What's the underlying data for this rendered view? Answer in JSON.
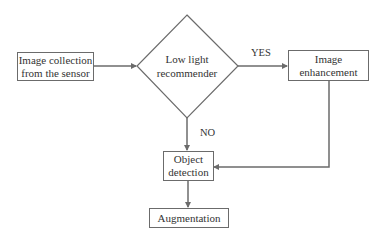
{
  "diagram": {
    "type": "flowchart",
    "nodes": {
      "collection": {
        "label_line1": "Image collection",
        "label_line2": "from the sensor",
        "shape": "rectangle"
      },
      "recommender": {
        "label_line1": "Low light",
        "label_line2": "recommender",
        "shape": "diamond"
      },
      "enhancement": {
        "label_line1": "Image",
        "label_line2": "enhancement",
        "shape": "rectangle"
      },
      "detection": {
        "label_line1": "Object",
        "label_line2": "detection",
        "shape": "rectangle"
      },
      "augmentation": {
        "label": "Augmentation",
        "shape": "rectangle"
      }
    },
    "edges": [
      {
        "from": "collection",
        "to": "recommender",
        "label": ""
      },
      {
        "from": "recommender",
        "to": "enhancement",
        "label": "YES"
      },
      {
        "from": "recommender",
        "to": "detection",
        "label": "NO"
      },
      {
        "from": "enhancement",
        "to": "detection",
        "label": ""
      },
      {
        "from": "detection",
        "to": "augmentation",
        "label": ""
      }
    ],
    "edge_labels": {
      "yes": "YES",
      "no": "NO"
    },
    "colors": {
      "line": "#6b6b6b",
      "text": "#333333",
      "background": "#ffffff"
    }
  }
}
